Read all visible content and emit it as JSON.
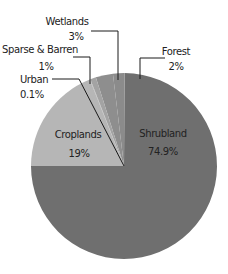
{
  "chart_data": {
    "type": "pie",
    "title": "",
    "categories": [
      "Shrubland",
      "Forest",
      "Wetlands",
      "Sparse & Barren",
      "Urban",
      "Croplands"
    ],
    "values": [
      74.9,
      2,
      3,
      1,
      0.1,
      19
    ],
    "value_labels": [
      "74.9%",
      "2%",
      "3%",
      "1%",
      "0.1%",
      "19%"
    ],
    "colors": [
      "#6f6f6f",
      "#8b8b8b",
      "#8e8e8e",
      "#a3a3a3",
      "#b0b0b0",
      "#b6b6b6"
    ],
    "start_angle_deg": 180,
    "direction": "counterclockwise",
    "legend": "none (callout labels)",
    "label_positions": {
      "inside": [
        "Shrubland",
        "Croplands"
      ],
      "callout": [
        "Forest",
        "Wetlands",
        "Sparse & Barren",
        "Urban"
      ]
    }
  },
  "labels": {
    "shrubland": {
      "name": "Shrubland",
      "value": "74.9%"
    },
    "forest": {
      "name": "Forest",
      "value": "2%"
    },
    "wetlands": {
      "name": "Wetlands",
      "value": "3%"
    },
    "sparse": {
      "name": "Sparse & Barren",
      "value": "1%"
    },
    "urban": {
      "name": "Urban",
      "value": "0.1%"
    },
    "croplands": {
      "name": "Croplands",
      "value": "19%"
    }
  }
}
